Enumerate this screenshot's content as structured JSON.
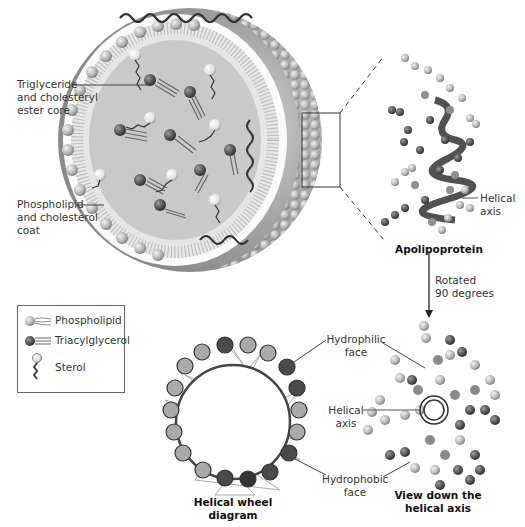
{
  "labels": {
    "core": [
      "Triglyceride",
      "and cholesteryl",
      "ester core"
    ],
    "coat": [
      "Phospholipid",
      "and cholesterol",
      "coat"
    ],
    "helical_axis_top": [
      "Helical",
      "axis"
    ],
    "apolipoprotein": "Apolipoprotein",
    "rotated": [
      "Rotated",
      "90 degrees"
    ],
    "hydrophilic": [
      "Hydrophilic",
      "face"
    ],
    "helical_axis_bottom": [
      "Helical",
      "axis"
    ],
    "hydrophobic": [
      "Hydrophobic",
      "face"
    ],
    "helical_wheel": [
      "Helical wheel",
      "diagram"
    ],
    "view_down": [
      "View down the",
      "helical axis"
    ]
  },
  "legend": {
    "items": [
      {
        "label": "Phospholipid",
        "icon": "phospholipid-icon"
      },
      {
        "label": "Triacylglycerol",
        "icon": "triacylglycerol-icon"
      },
      {
        "label": "Sterol",
        "icon": "sterol-icon"
      }
    ]
  },
  "colors": {
    "sphere_light": "#d0d0d0",
    "sphere_mid": "#a8a8a8",
    "sphere_dark": "#4a4a4a",
    "core_fill": "#c8c8c8",
    "line": "#555555"
  }
}
